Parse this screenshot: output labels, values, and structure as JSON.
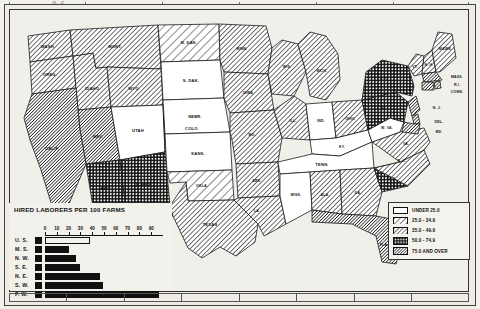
{
  "chart_data": {
    "type": "bar",
    "title": "HIRED LABORERS PER 100 FARMS",
    "orientation": "horizontal",
    "categories": [
      "U. S.",
      "M. S.",
      "N. W.",
      "S. E.",
      "N. E.",
      "S. W.",
      "F. W."
    ],
    "values": [
      38,
      20,
      26,
      30,
      47,
      49,
      97
    ],
    "xlabel": "",
    "ylabel": "",
    "xlim": [
      0,
      100
    ],
    "ticks": [
      0,
      10,
      20,
      30,
      40,
      50,
      60,
      70,
      80,
      90
    ],
    "tick_labels": [
      "0",
      "10",
      "20",
      "30",
      "40",
      "50",
      "60",
      "70",
      "80",
      "90"
    ],
    "grid": false,
    "legend_position": "none",
    "note": "U.S. bar drawn hollow (outline only); all other bars solid black"
  },
  "map": {
    "title": "HIRED LABORERS PER 100 FARMS",
    "legend": {
      "title": "",
      "items": [
        {
          "label": "UNDER 25.0",
          "pattern": "plain"
        },
        {
          "label": "25.0 - 34.9",
          "pattern": "hatch-light"
        },
        {
          "label": "35.0 - 49.9",
          "pattern": "hatch-medium"
        },
        {
          "label": "50.0 - 74.9",
          "pattern": "dotted"
        },
        {
          "label": "75.0 AND OVER",
          "pattern": "hatch-heavy"
        }
      ]
    },
    "states": [
      {
        "name": "WASH.",
        "class": "hatch-medium"
      },
      {
        "name": "OREG.",
        "class": "hatch-medium"
      },
      {
        "name": "IDAHO",
        "class": "hatch-medium"
      },
      {
        "name": "MONT.",
        "class": "hatch-medium"
      },
      {
        "name": "WYO.",
        "class": "hatch-medium"
      },
      {
        "name": "NEV.",
        "class": "hatch-heavy"
      },
      {
        "name": "CALIF.",
        "class": "hatch-heavy"
      },
      {
        "name": "UTAH",
        "class": "plain"
      },
      {
        "name": "COLO.",
        "class": "dotted"
      },
      {
        "name": "ARIZ.",
        "class": "dotted"
      },
      {
        "name": "N. MEX.",
        "class": "dotted"
      },
      {
        "name": "N. DAK.",
        "class": "hatch-light"
      },
      {
        "name": "S. DAK.",
        "class": "plain"
      },
      {
        "name": "NEBR.",
        "class": "plain"
      },
      {
        "name": "KANS.",
        "class": "plain"
      },
      {
        "name": "OKLA.",
        "class": "hatch-light"
      },
      {
        "name": "TEXAS",
        "class": "hatch-medium"
      },
      {
        "name": "MINN.",
        "class": "hatch-medium"
      },
      {
        "name": "IOWA",
        "class": "hatch-medium"
      },
      {
        "name": "MO.",
        "class": "hatch-medium"
      },
      {
        "name": "ARK.",
        "class": "hatch-medium"
      },
      {
        "name": "LA.",
        "class": "hatch-medium"
      },
      {
        "name": "WIS.",
        "class": "hatch-medium"
      },
      {
        "name": "ILL.",
        "class": "hatch-medium"
      },
      {
        "name": "MICH.",
        "class": "hatch-medium"
      },
      {
        "name": "IND.",
        "class": "plain"
      },
      {
        "name": "OHIO",
        "class": "hatch-medium"
      },
      {
        "name": "KY.",
        "class": "plain"
      },
      {
        "name": "TENN.",
        "class": "plain"
      },
      {
        "name": "MISS.",
        "class": "plain"
      },
      {
        "name": "ALA.",
        "class": "hatch-medium"
      },
      {
        "name": "GA.",
        "class": "hatch-medium"
      },
      {
        "name": "FLA.",
        "class": "hatch-heavy"
      },
      {
        "name": "S. C.",
        "class": "dotted"
      },
      {
        "name": "N. C.",
        "class": "hatch-medium"
      },
      {
        "name": "VA.",
        "class": "hatch-medium"
      },
      {
        "name": "W. VA.",
        "class": "plain"
      },
      {
        "name": "PA.",
        "class": "dotted"
      },
      {
        "name": "N. Y.",
        "class": "dotted"
      },
      {
        "name": "VT.",
        "class": "hatch-medium"
      },
      {
        "name": "N. H.",
        "class": "hatch-medium"
      },
      {
        "name": "MAINE",
        "class": "hatch-medium"
      },
      {
        "name": "MASS.",
        "class": "hatch-heavy"
      },
      {
        "name": "R.I.",
        "class": "hatch-heavy"
      },
      {
        "name": "CONN.",
        "class": "hatch-heavy"
      },
      {
        "name": "N. J.",
        "class": "hatch-heavy"
      },
      {
        "name": "DEL.",
        "class": "hatch-heavy"
      },
      {
        "name": "MD.",
        "class": "hatch-heavy"
      }
    ]
  },
  "artifacts": {
    "top_smudge": "9-6"
  }
}
